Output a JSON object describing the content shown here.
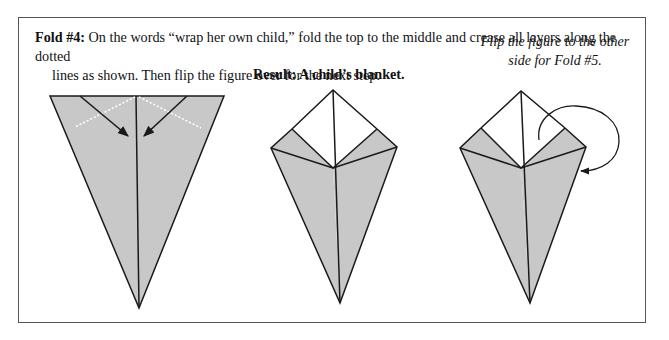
{
  "instruction": {
    "label": "Fold #4:",
    "line1": " On the words “wrap her own child,” fold the top to the middle and crease all layers along the dotted",
    "line2": "lines as shown. Then flip the figure over for the next step."
  },
  "figures": {
    "left": {
      "description": "Kite shape with top corners folded toward center along dotted lines"
    },
    "middle": {
      "caption": "Result: A child’s blanket."
    },
    "right": {
      "caption_line1": "Flip the figure to the other",
      "caption_line2": "side for Fold #5."
    }
  },
  "colors": {
    "fill": "#c8c8c8",
    "stroke": "#1a1a1a",
    "border": "#555555"
  }
}
